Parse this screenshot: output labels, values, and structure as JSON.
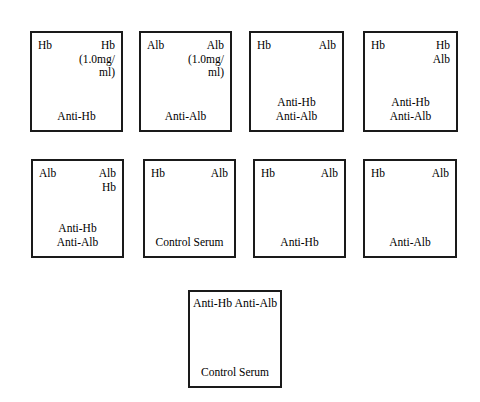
{
  "diagram": {
    "background_color": "#ffffff",
    "border_color": "#1a1a1a",
    "text_color": "#000000",
    "rows": [
      {
        "row_name": "row-1",
        "plates": [
          {
            "plate_name": "plate-1",
            "antigen_left": "Hb",
            "antigen_right": "Hb",
            "antigen_right_sub1": "(1.0mg/",
            "antigen_right_sub2": "ml)",
            "antibody_1": "Anti-Hb",
            "antibody_2": ""
          },
          {
            "plate_name": "plate-2",
            "antigen_left": "Alb",
            "antigen_right": "Alb",
            "antigen_right_sub1": "(1.0mg/",
            "antigen_right_sub2": "ml)",
            "antibody_1": "Anti-Alb",
            "antibody_2": ""
          },
          {
            "plate_name": "plate-3",
            "antigen_left": "Hb",
            "antigen_right": "Alb",
            "antigen_right_sub1": "",
            "antigen_right_sub2": "",
            "antibody_1": "Anti-Hb",
            "antibody_2": "Anti-Alb"
          },
          {
            "plate_name": "plate-4",
            "antigen_left": "Hb",
            "antigen_right": "Hb",
            "antigen_right_sub1": "Alb",
            "antigen_right_sub2": "",
            "antibody_1": "Anti-Hb",
            "antibody_2": "Anti-Alb"
          }
        ]
      },
      {
        "row_name": "row-2",
        "plates": [
          {
            "plate_name": "plate-5",
            "antigen_left": "Alb",
            "antigen_right": "Alb",
            "antigen_right_sub1": "Hb",
            "antigen_right_sub2": "",
            "antibody_1": "Anti-Hb",
            "antibody_2": "Anti-Alb"
          },
          {
            "plate_name": "plate-6",
            "antigen_left": "Hb",
            "antigen_right": "Alb",
            "antigen_right_sub1": "",
            "antigen_right_sub2": "",
            "antibody_1": "Control Serum",
            "antibody_2": ""
          },
          {
            "plate_name": "plate-7",
            "antigen_left": "Hb",
            "antigen_right": "Alb",
            "antigen_right_sub1": "",
            "antigen_right_sub2": "",
            "antibody_1": "Anti-Hb",
            "antibody_2": ""
          },
          {
            "plate_name": "plate-8",
            "antigen_left": "Hb",
            "antigen_right": "Alb",
            "antigen_right_sub1": "",
            "antigen_right_sub2": "",
            "antibody_1": "Anti-Alb",
            "antibody_2": ""
          }
        ]
      },
      {
        "row_name": "row-3",
        "plates": [
          {
            "plate_name": "plate-9",
            "top_antibodies": "Anti-Hb Anti-Alb",
            "antibody_1": "Control Serum",
            "antibody_2": ""
          }
        ]
      }
    ]
  }
}
